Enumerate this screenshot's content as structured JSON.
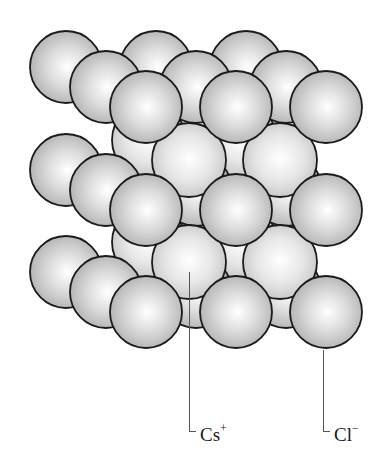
{
  "figure": {
    "colors": {
      "background": "#ffffff",
      "sphere_outline": "#1a1a1a",
      "cl_sphere_fill": "#cfcfcf",
      "cs_sphere_fill": "#e4e4e4",
      "leader_line": "#555555",
      "label_text": "#1a1a1a"
    },
    "labels": {
      "cs": {
        "element": "Cs",
        "charge": "+"
      },
      "cl": {
        "element": "Cl",
        "charge": "−"
      }
    },
    "lattice": {
      "cl_radius": 36,
      "cs_radius": 37,
      "cl_back_layer": [
        [
          66,
          67
        ],
        [
          156,
          67
        ],
        [
          246,
          67
        ],
        [
          66,
          170
        ],
        [
          156,
          170
        ],
        [
          246,
          170
        ],
        [
          66,
          272
        ],
        [
          156,
          272
        ],
        [
          246,
          272
        ]
      ],
      "cs_back_layer": [
        [
          149,
          140
        ],
        [
          240,
          140
        ],
        [
          149,
          242
        ],
        [
          240,
          242
        ]
      ],
      "cl_middle_layer": [
        [
          106,
          87
        ],
        [
          196,
          87
        ],
        [
          286,
          87
        ],
        [
          106,
          190
        ],
        [
          196,
          190
        ],
        [
          286,
          190
        ],
        [
          106,
          292
        ],
        [
          196,
          292
        ],
        [
          286,
          292
        ]
      ],
      "cs_front_layer": [
        [
          189,
          160
        ],
        [
          280,
          160
        ],
        [
          189,
          262
        ],
        [
          280,
          262
        ]
      ],
      "cl_front_layer": [
        [
          146,
          107
        ],
        [
          236,
          107
        ],
        [
          326,
          107
        ],
        [
          146,
          210
        ],
        [
          236,
          210
        ],
        [
          326,
          210
        ],
        [
          146,
          312
        ],
        [
          236,
          312
        ],
        [
          326,
          312
        ]
      ]
    }
  }
}
